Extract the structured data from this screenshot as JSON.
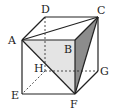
{
  "figure": {
    "type": "cube",
    "name": "ABCD-EFGH",
    "highlighted_triangle": [
      "A",
      "C",
      "F"
    ],
    "colors": {
      "edge": "#222222",
      "face_light": "#e4e4e4",
      "face_dark": "#8c8c8c",
      "background": "#ffffff"
    }
  },
  "vertices": {
    "A": {
      "label": "A",
      "x": 22,
      "y": 40
    },
    "B": {
      "label": "B",
      "x": 75,
      "y": 40
    },
    "C": {
      "label": "C",
      "x": 98,
      "y": 17
    },
    "D": {
      "label": "D",
      "x": 45,
      "y": 17
    },
    "E": {
      "label": "E",
      "x": 22,
      "y": 94
    },
    "F": {
      "label": "F",
      "x": 75,
      "y": 94
    },
    "G": {
      "label": "G",
      "x": 98,
      "y": 71
    },
    "H": {
      "label": "H",
      "x": 45,
      "y": 71
    }
  },
  "edges": {
    "solid": [
      [
        "A",
        "B"
      ],
      [
        "B",
        "C"
      ],
      [
        "C",
        "D"
      ],
      [
        "D",
        "A"
      ],
      [
        "A",
        "E"
      ],
      [
        "B",
        "F"
      ],
      [
        "C",
        "G"
      ],
      [
        "E",
        "F"
      ],
      [
        "F",
        "G"
      ],
      [
        "A",
        "C"
      ],
      [
        "A",
        "F"
      ],
      [
        "C",
        "F"
      ]
    ],
    "dashed": [
      [
        "D",
        "H"
      ],
      [
        "H",
        "E"
      ],
      [
        "H",
        "G"
      ]
    ]
  }
}
